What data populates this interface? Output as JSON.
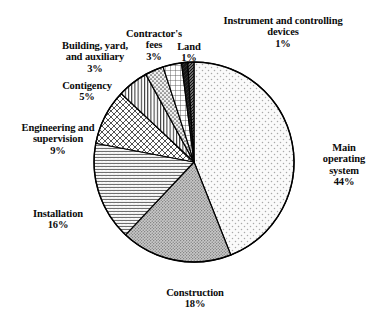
{
  "chart_data": {
    "type": "pie",
    "title": "",
    "subtitle": "",
    "xlabel": "",
    "ylabel": "",
    "legend_position": "none",
    "grid": false,
    "units": "percent",
    "total": 100,
    "start_angle_deg": 0,
    "direction": "clockwise",
    "categories": [
      "Main operating system",
      "Construction",
      "Installation",
      "Engineering and supervision",
      "Contigency",
      "Building, yard, and auxiliary",
      "Contractor's fees",
      "Land",
      "Instrument and controlling devices"
    ],
    "values": [
      44,
      18,
      16,
      9,
      5,
      3,
      3,
      1,
      1
    ],
    "slices": [
      {
        "id": "main-operating-system",
        "label": "Main\noperating\nsystem",
        "label_full": "Main operating system",
        "pct_text": "44%",
        "value": 44,
        "pattern": "sparse-dots-light",
        "fill": "#f4f4f4",
        "ink": "#8a8a8a"
      },
      {
        "id": "construction",
        "label": "Construction",
        "label_full": "Construction",
        "pct_text": "18%",
        "value": 18,
        "pattern": "dense-stipple-gray",
        "fill": "#b6b6b6",
        "ink": "#5d5d5d"
      },
      {
        "id": "installation",
        "label": "Installation",
        "label_full": "Installation",
        "pct_text": "16%",
        "value": 16,
        "pattern": "horizontal-wavy-lines",
        "fill": "#ffffff",
        "ink": "#3b3b3b"
      },
      {
        "id": "engineering-and-supervision",
        "label": "Engineering and\nsupervision",
        "label_full": "Engineering and supervision",
        "pct_text": "9%",
        "value": 9,
        "pattern": "diagonal-crosshatch",
        "fill": "#ffffff",
        "ink": "#2e2e2e"
      },
      {
        "id": "contigency",
        "label": "Contigency",
        "label_full": "Contigency",
        "pct_text": "5%",
        "value": 5,
        "pattern": "vertical-lines",
        "fill": "#ffffff",
        "ink": "#303030"
      },
      {
        "id": "building-yard-and-auxiliary",
        "label": "Building, yard,\nand auxiliary",
        "label_full": "Building, yard, and auxiliary",
        "pct_text": "3%",
        "value": 3,
        "pattern": "medium-dots",
        "fill": "#ededed",
        "ink": "#4a4a4a"
      },
      {
        "id": "contractors-fees",
        "label": "Contractor's\nfees",
        "label_full": "Contractor's fees",
        "pct_text": "3%",
        "value": 3,
        "pattern": "grid-squares",
        "fill": "#ffffff",
        "ink": "#4f4f4f"
      },
      {
        "id": "land",
        "label": "Land",
        "label_full": "Land",
        "pct_text": "1%",
        "value": 1,
        "pattern": "solid-dark",
        "fill": "#171717",
        "ink": "#000000"
      },
      {
        "id": "instrument-and-controlling-devices",
        "label": "Instrument and\ncontrolling devices",
        "label_full": "Instrument and controlling devices",
        "pct_text": "1%",
        "value": 1,
        "pattern": "dense-dark-hatch",
        "fill": "#555555",
        "ink": "#0a0a0a"
      }
    ],
    "geometry": {
      "center_x": 194,
      "center_y": 162,
      "radius": 100,
      "stroke": "#000000"
    }
  }
}
